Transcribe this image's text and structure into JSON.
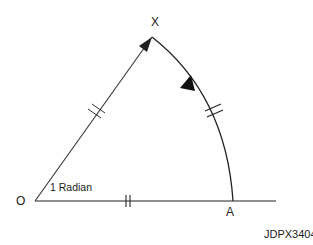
{
  "diagram": {
    "type": "radian-definition",
    "labels": {
      "center": "O",
      "apex": "X",
      "arc_end": "A",
      "angle": "1 Radian",
      "figure_id": "JDPX3404"
    },
    "points": {
      "O": [
        35,
        201
      ],
      "X": [
        152,
        37
      ],
      "A": [
        233,
        201
      ],
      "baseline_end": [
        276,
        201
      ]
    },
    "colors": {
      "stroke": "#222222",
      "background": "#ffffff"
    }
  }
}
